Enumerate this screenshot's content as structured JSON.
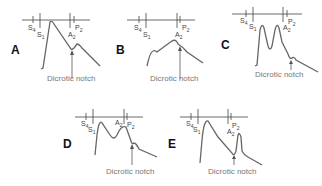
{
  "figure": {
    "annotation_label": "Dicrotic notch",
    "heart_sound_labels": {
      "s4": "S4",
      "s1": "S1",
      "a2": "A2",
      "p2": "P2"
    },
    "panels": [
      {
        "id": "A",
        "label": "A",
        "description": "Normal arterial pulse with single upstroke and dicrotic notch"
      },
      {
        "id": "B",
        "label": "B",
        "description": "Slow-rising, delayed peak pulse (parvus et tardus)"
      },
      {
        "id": "C",
        "label": "C",
        "description": "Bisferiens pulse with two systolic peaks"
      },
      {
        "id": "D",
        "label": "D",
        "description": "Bifid pulse with early peak and late systolic peak"
      },
      {
        "id": "E",
        "label": "E",
        "description": "Dicrotic pulse with prominent diastolic wave after notch"
      }
    ]
  },
  "colors": {
    "curve": "#666666",
    "axis": "#444444",
    "label": "#111111",
    "annotation": "#777777"
  }
}
